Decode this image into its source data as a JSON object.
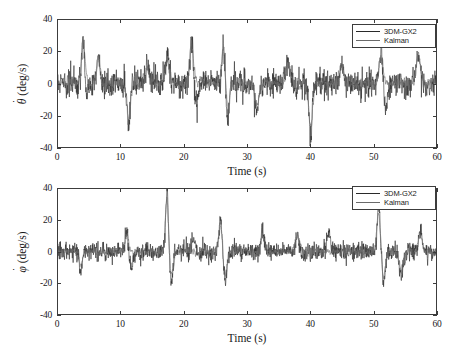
{
  "figure": {
    "background": "#ffffff",
    "axis_color": "#3c3c3c"
  },
  "series_colors": {
    "sensor": "#2a2a2a",
    "kalman": "#6e6e6e"
  },
  "legend": {
    "sensor_label": "3DM-GX2",
    "kalman_label": "Kalman"
  },
  "chart_data": [
    {
      "type": "line",
      "id": "theta-dot",
      "title": "",
      "xlabel": "Time (s)",
      "ylabel": "θ̇ (deg/s)",
      "ylabel_symbol": "θ",
      "ylabel_units": "(deg/s)",
      "xlim": [
        0,
        60
      ],
      "ylim": [
        -40,
        40
      ],
      "xticks": [
        0,
        10,
        20,
        30,
        40,
        50,
        60
      ],
      "xticklabels": [
        "0",
        "10",
        "20",
        "30",
        "40",
        "50",
        "60"
      ],
      "yticks": [
        -40,
        -20,
        0,
        20,
        40
      ],
      "yticklabels": [
        "-40",
        "-20",
        "0",
        "20",
        "40"
      ],
      "grid": false,
      "legend_position": "top-right",
      "series": [
        {
          "name": "3DM-GX2",
          "color": "#2a2a2a",
          "noise_sigma": 4.2,
          "seed": 1771,
          "spikes": [
            {
              "t": 4.0,
              "amp": 32.0,
              "width": 0.22
            },
            {
              "t": 4.5,
              "amp": -9.0,
              "width": 0.3
            },
            {
              "t": 6.4,
              "amp": 16.0,
              "width": 0.25
            },
            {
              "t": 11.2,
              "amp": -27.0,
              "width": 0.22
            },
            {
              "t": 14.2,
              "amp": 13.0,
              "width": 0.3
            },
            {
              "t": 17.4,
              "amp": 17.0,
              "width": 0.3
            },
            {
              "t": 21.2,
              "amp": 27.0,
              "width": 0.25
            },
            {
              "t": 22.0,
              "amp": -13.0,
              "width": 0.3
            },
            {
              "t": 26.3,
              "amp": 28.0,
              "width": 0.22
            },
            {
              "t": 26.9,
              "amp": -22.0,
              "width": 0.25
            },
            {
              "t": 31.6,
              "amp": -16.0,
              "width": 0.3
            },
            {
              "t": 36.5,
              "amp": 14.0,
              "width": 0.3
            },
            {
              "t": 40.1,
              "amp": -33.0,
              "width": 0.22
            },
            {
              "t": 45.0,
              "amp": 12.0,
              "width": 0.3
            },
            {
              "t": 51.3,
              "amp": 20.0,
              "width": 0.28
            },
            {
              "t": 52.0,
              "amp": -17.0,
              "width": 0.3
            },
            {
              "t": 57.2,
              "amp": 18.0,
              "width": 0.3
            }
          ]
        },
        {
          "name": "Kalman",
          "color": "#6e6e6e",
          "noise_sigma": 2.9,
          "seed": 907,
          "smoothing": 3,
          "spikes": [
            {
              "t": 4.0,
              "amp": 28.0,
              "width": 0.3
            },
            {
              "t": 6.4,
              "amp": 14.0,
              "width": 0.3
            },
            {
              "t": 11.2,
              "amp": -23.0,
              "width": 0.3
            },
            {
              "t": 14.2,
              "amp": 11.0,
              "width": 0.34
            },
            {
              "t": 17.4,
              "amp": 15.0,
              "width": 0.34
            },
            {
              "t": 21.2,
              "amp": 24.0,
              "width": 0.3
            },
            {
              "t": 26.3,
              "amp": 25.0,
              "width": 0.3
            },
            {
              "t": 26.9,
              "amp": -19.0,
              "width": 0.3
            },
            {
              "t": 31.6,
              "amp": -14.0,
              "width": 0.34
            },
            {
              "t": 36.5,
              "amp": 12.0,
              "width": 0.34
            },
            {
              "t": 40.1,
              "amp": -29.0,
              "width": 0.3
            },
            {
              "t": 45.0,
              "amp": 10.0,
              "width": 0.34
            },
            {
              "t": 51.3,
              "amp": 18.0,
              "width": 0.32
            },
            {
              "t": 57.2,
              "amp": 16.0,
              "width": 0.34
            }
          ]
        }
      ]
    },
    {
      "type": "line",
      "id": "phi-dot",
      "title": "",
      "xlabel": "Time (s)",
      "ylabel": "φ̇ (deg/s)",
      "ylabel_symbol": "φ",
      "ylabel_units": "(deg/s)",
      "xlim": [
        0,
        60
      ],
      "ylim": [
        -40,
        40
      ],
      "xticks": [
        0,
        10,
        20,
        30,
        40,
        50,
        60
      ],
      "xticklabels": [
        "0",
        "10",
        "20",
        "30",
        "40",
        "50",
        "60"
      ],
      "yticks": [
        -40,
        -20,
        0,
        20,
        40
      ],
      "yticklabels": [
        "-40",
        "-20",
        "0",
        "20",
        "40"
      ],
      "grid": false,
      "legend_position": "top-right",
      "series": [
        {
          "name": "3DM-GX2",
          "color": "#2a2a2a",
          "noise_sigma": 3.0,
          "seed": 4421,
          "spikes": [
            {
              "t": 3.6,
              "amp": -11.0,
              "width": 0.25
            },
            {
              "t": 10.9,
              "amp": 13.0,
              "width": 0.25
            },
            {
              "t": 11.6,
              "amp": -10.0,
              "width": 0.3
            },
            {
              "t": 17.3,
              "amp": 40.0,
              "width": 0.2
            },
            {
              "t": 18.0,
              "amp": -19.0,
              "width": 0.25
            },
            {
              "t": 21.5,
              "amp": 10.0,
              "width": 0.3
            },
            {
              "t": 25.8,
              "amp": 20.0,
              "width": 0.25
            },
            {
              "t": 26.5,
              "amp": -19.0,
              "width": 0.28
            },
            {
              "t": 32.5,
              "amp": 12.0,
              "width": 0.3
            },
            {
              "t": 38.0,
              "amp": 11.0,
              "width": 0.3
            },
            {
              "t": 43.0,
              "amp": 10.0,
              "width": 0.3
            },
            {
              "t": 50.9,
              "amp": 30.0,
              "width": 0.22
            },
            {
              "t": 51.7,
              "amp": -20.0,
              "width": 0.25
            },
            {
              "t": 54.5,
              "amp": -16.0,
              "width": 0.28
            },
            {
              "t": 57.5,
              "amp": 12.0,
              "width": 0.3
            }
          ]
        },
        {
          "name": "Kalman",
          "color": "#6e6e6e",
          "noise_sigma": 2.1,
          "seed": 2203,
          "smoothing": 3,
          "spikes": [
            {
              "t": 3.6,
              "amp": -9.0,
              "width": 0.3
            },
            {
              "t": 10.9,
              "amp": 11.0,
              "width": 0.3
            },
            {
              "t": 17.3,
              "amp": 35.0,
              "width": 0.26
            },
            {
              "t": 18.0,
              "amp": -16.0,
              "width": 0.3
            },
            {
              "t": 25.8,
              "amp": 18.0,
              "width": 0.3
            },
            {
              "t": 26.5,
              "amp": -16.0,
              "width": 0.3
            },
            {
              "t": 32.5,
              "amp": 10.0,
              "width": 0.34
            },
            {
              "t": 38.0,
              "amp": 9.0,
              "width": 0.34
            },
            {
              "t": 50.9,
              "amp": 26.0,
              "width": 0.28
            },
            {
              "t": 51.7,
              "amp": -17.0,
              "width": 0.3
            },
            {
              "t": 54.5,
              "amp": -13.0,
              "width": 0.3
            },
            {
              "t": 57.5,
              "amp": 10.0,
              "width": 0.34
            }
          ]
        }
      ]
    }
  ]
}
